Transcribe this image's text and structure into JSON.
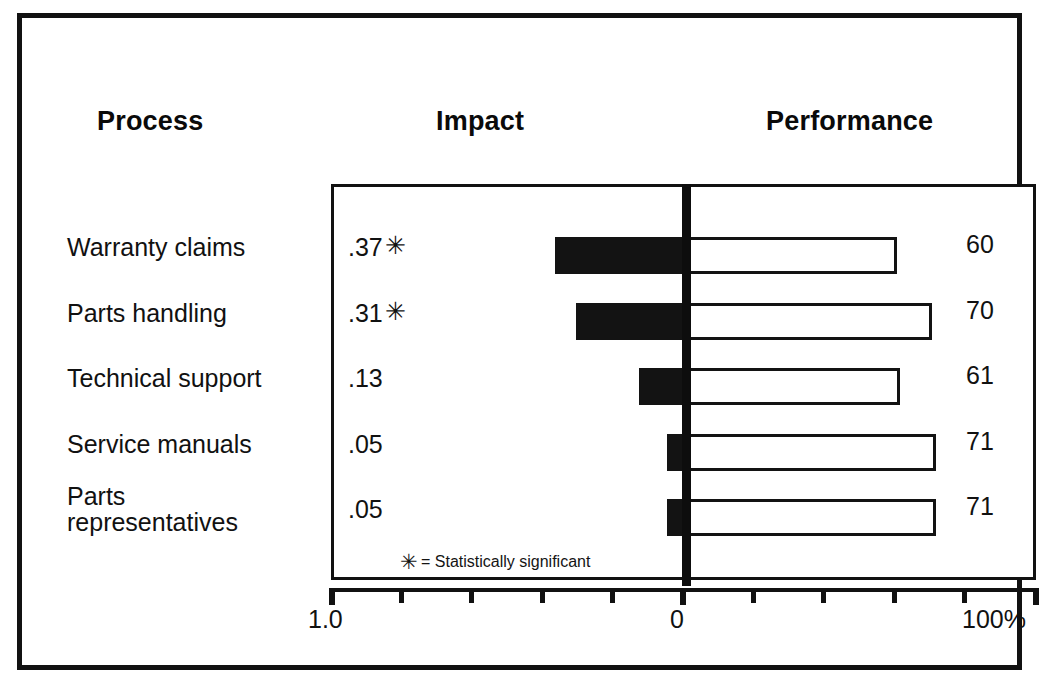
{
  "figure": {
    "headers": {
      "process": "Process",
      "impact": "Impact",
      "performance": "Performance"
    },
    "footnote": {
      "star": "✳",
      "text": "= Statistically significant"
    },
    "axis": {
      "left_label": "1.0",
      "center_label": "0",
      "right_label": "100%"
    }
  },
  "chart_data": {
    "type": "bar",
    "title": "",
    "subtitle": "",
    "orientation": "horizontal",
    "style": "diverging-tornado",
    "categories": [
      "Warranty claims",
      "Parts handling",
      "Technical support",
      "Service manuals",
      "Parts\nrepresentatives"
    ],
    "series": [
      {
        "name": "Impact",
        "side": "left",
        "axis_range": [
          1.0,
          0
        ],
        "axis_direction": "right-to-left",
        "fill": "#131313",
        "values": [
          0.37,
          0.31,
          0.13,
          0.05,
          0.05
        ],
        "value_labels": [
          ".37",
          ".31",
          ".13",
          ".05",
          ".05"
        ],
        "significant": [
          true,
          true,
          false,
          false,
          false
        ]
      },
      {
        "name": "Performance",
        "side": "right",
        "axis_range": [
          0,
          100
        ],
        "axis_unit": "%",
        "fill": "#ffffff",
        "stroke": "#131313",
        "values": [
          60,
          70,
          61,
          71,
          71
        ],
        "value_labels": [
          "60",
          "70",
          "61",
          "71",
          "71"
        ]
      }
    ],
    "xlabel": "",
    "ylabel": "",
    "grid": false,
    "legend": "none",
    "annotations": [
      "✳ = Statistically significant"
    ],
    "axis_ticks_left": [
      1.0,
      0.8,
      0.6,
      0.4,
      0.2,
      0
    ],
    "axis_ticks_right": [
      0,
      20,
      40,
      60,
      80,
      100
    ],
    "colors": {
      "ink": "#111111",
      "impact_bar": "#131313",
      "performance_bar": "#ffffff",
      "background": "#ffffff"
    }
  }
}
